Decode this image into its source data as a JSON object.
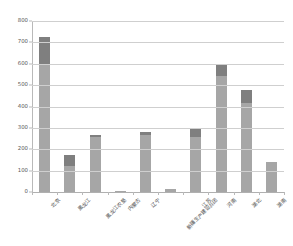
{
  "chart_data": {
    "type": "bar",
    "stacked": true,
    "title": "",
    "subtitle": "",
    "xlabel": "",
    "ylabel": "",
    "ylim": [
      0,
      800
    ],
    "ytick_step": 100,
    "ytick_labels": [
      "800",
      "700",
      "600",
      "500",
      "400",
      "300",
      "200",
      "100",
      "0"
    ],
    "ytick_values": [
      800,
      700,
      600,
      500,
      400,
      300,
      200,
      100,
      0
    ],
    "grid": true,
    "grid_axis": "y",
    "legend": false,
    "legend_position": "none",
    "categories": [
      "北京",
      "黑龙江",
      "黑龙江农垦",
      "内蒙古",
      "辽宁",
      "新疆生产建设兵团",
      "江苏",
      "河南",
      "湖北",
      "湖南"
    ],
    "series": [
      {
        "name": "下层",
        "color": "#a6a6a6",
        "values": [
          595,
          120,
          258,
          3,
          265,
          12,
          258,
          545,
          415,
          140
        ]
      },
      {
        "name": "上层",
        "color": "#7f7f7f",
        "values": [
          130,
          55,
          10,
          0,
          18,
          0,
          35,
          52,
          60,
          0
        ]
      }
    ],
    "totals": [
      725,
      175,
      268,
      3,
      283,
      12,
      293,
      597,
      475,
      140
    ],
    "colors": {
      "series_bottom": "#a6a6a6",
      "series_top": "#7f7f7f",
      "gridline": "#cfcfcf",
      "axis": "#b9b9b9",
      "tick_text": "#595959",
      "label_text": "#4d4d4d",
      "background": "#ffffff"
    }
  }
}
